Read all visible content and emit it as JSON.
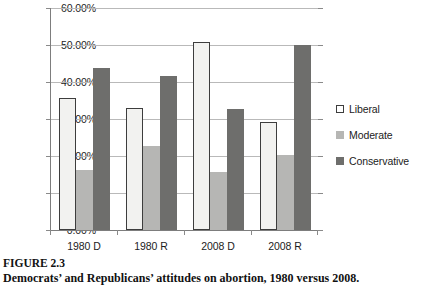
{
  "chart_data": {
    "type": "bar",
    "title": "",
    "xlabel": "",
    "ylabel": "",
    "ylim": [
      0,
      60
    ],
    "ytick_labels": [
      "60.00%",
      "50.00%",
      "40.00%",
      "30.00%",
      "20.00%",
      "10.00%",
      "0.00%"
    ],
    "ytick_values": [
      60,
      50,
      40,
      30,
      20,
      10,
      0
    ],
    "grid": true,
    "legend_position": "right",
    "categories": [
      "1980 D",
      "1980 R",
      "2008 D",
      "2008 R"
    ],
    "series": [
      {
        "name": "Liberal",
        "color": "#f2f2f0",
        "values": [
          35.8,
          32.9,
          50.7,
          29.2
        ]
      },
      {
        "name": "Moderate",
        "color": "#b6b6b4",
        "values": [
          16.3,
          22.6,
          15.6,
          20.2
        ]
      },
      {
        "name": "Conservative",
        "color": "#6e6e6c",
        "values": [
          43.7,
          41.6,
          32.6,
          50.0
        ]
      }
    ]
  },
  "legend": {
    "items": [
      {
        "label": "Liberal"
      },
      {
        "label": "Moderate"
      },
      {
        "label": "Conservative"
      }
    ]
  },
  "caption": {
    "figure_label": "FIGURE 2.3",
    "text": "Democrats’ and Republicans’ attitudes on abortion, 1980 versus 2008."
  }
}
